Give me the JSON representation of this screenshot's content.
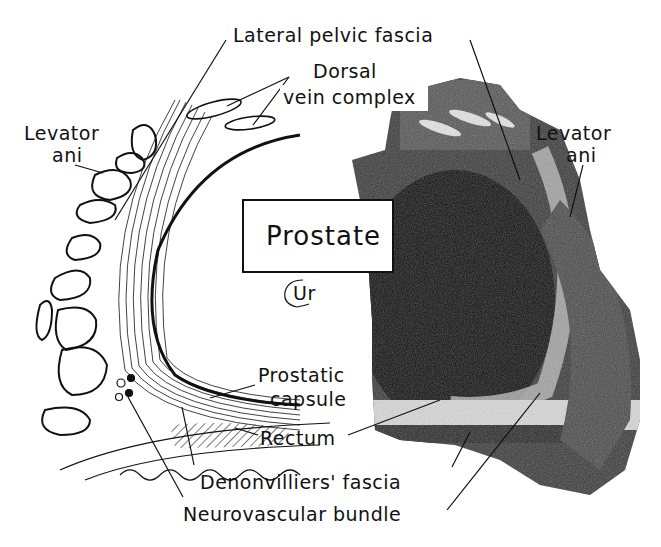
{
  "figure": {
    "labels": {
      "lateral_pelvic_fascia": "Lateral pelvic fascia",
      "dorsal_vein_complex_line1": "Dorsal",
      "dorsal_vein_complex_line2": "vein complex",
      "levator_ani_left_line1": "Levator",
      "levator_ani_left_line2": "ani",
      "levator_ani_right_line1": "Levator",
      "levator_ani_right_line2": "ani",
      "prostate": "Prostate",
      "urethra": "Ur",
      "prostatic_capsule_line1": "Prostatic",
      "prostatic_capsule_line2": "capsule",
      "rectum": "Rectum",
      "denonvilliers_fascia": "Denonvilliers' fascia",
      "neurovascular_bundle": "Neurovascular bundle"
    },
    "colors": {
      "ink": "#111111",
      "background": "#ffffff",
      "histology_dark": "#1a1a1a",
      "histology_mid": "#555555",
      "histology_light": "#bdbdbd"
    }
  }
}
